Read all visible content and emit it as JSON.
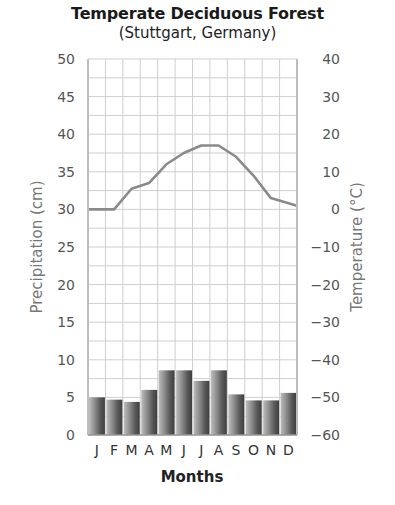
{
  "chart_data": {
    "type": "bar+line",
    "title": "Temperate Deciduous Forest",
    "subtitle": "(Stuttgart, Germany)",
    "xlabel": "Months",
    "categories": [
      "J",
      "F",
      "M",
      "A",
      "M",
      "J",
      "J",
      "A",
      "S",
      "O",
      "N",
      "D"
    ],
    "series": [
      {
        "name": "Precipitation (cm)",
        "type": "bar",
        "axis": "left",
        "values": [
          5.0,
          4.7,
          4.4,
          6.0,
          8.6,
          8.6,
          7.2,
          8.6,
          5.4,
          4.6,
          4.6,
          5.6
        ]
      },
      {
        "name": "Temperature (°C)",
        "type": "line",
        "axis": "right",
        "values": [
          0,
          0,
          5.5,
          7,
          12,
          15,
          17,
          17,
          14,
          9,
          3,
          1
        ]
      }
    ],
    "left_axis": {
      "label": "Precipitation (cm)",
      "range": [
        0,
        50
      ],
      "ticks": [
        0,
        5,
        10,
        15,
        20,
        25,
        30,
        35,
        40,
        45,
        50
      ]
    },
    "right_axis": {
      "label": "Temperature (°C)",
      "range": [
        -60,
        40
      ],
      "ticks": [
        40,
        30,
        20,
        10,
        0,
        -10,
        -20,
        -30,
        -40,
        -50,
        -60
      ]
    },
    "grid": true,
    "legend": "none"
  },
  "labels": {
    "title": "Temperate Deciduous Forest",
    "subtitle": "(Stuttgart, Germany)",
    "xlabel": "Months",
    "ylabel_left": "Precipitation (cm)",
    "ylabel_right": "Temperature (°C)"
  },
  "colors": {
    "line": "#8a8a8a",
    "grid": "#cfcfcf",
    "bar_light": "#c8c8c8",
    "bar_dark": "#4a4a4a"
  }
}
